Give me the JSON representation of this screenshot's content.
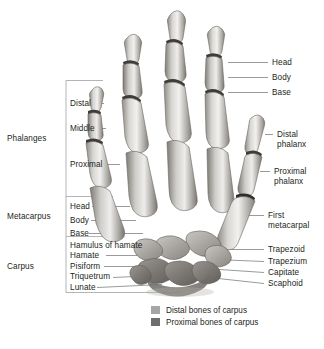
{
  "figure": {
    "title_alt": "Bones of the hand - anterior view",
    "colors": {
      "text": "#231f20",
      "leader_line": "#6d6e71",
      "bracket_line": "#939598",
      "bone_light": "#e8e6e3",
      "bone_mid": "#b9b6b2",
      "bone_dark": "#8a8782",
      "bone_outline": "#6a6763",
      "joint_dark": "#3a3a3a",
      "distal_carpus_swatch": "#a6a6a6",
      "proximal_carpus_swatch": "#6e6e6e",
      "background": "#ffffff"
    }
  },
  "groups": [
    {
      "id": "phalanges",
      "label": "Phalanges"
    },
    {
      "id": "metacarpus",
      "label": "Metacarpus"
    },
    {
      "id": "carpus",
      "label": "Carpus"
    }
  ],
  "left_labels": [
    {
      "id": "distal",
      "label": "Distal"
    },
    {
      "id": "middle",
      "label": "Middle"
    },
    {
      "id": "proximal",
      "label": "Proximal"
    },
    {
      "id": "head",
      "label": "Head"
    },
    {
      "id": "body",
      "label": "Body"
    },
    {
      "id": "base",
      "label": "Base"
    },
    {
      "id": "hamulus-of-hamate",
      "label": "Hamulus of hamate"
    },
    {
      "id": "hamate",
      "label": "Hamate"
    },
    {
      "id": "pisiform",
      "label": "Pisiform"
    },
    {
      "id": "triquetrum",
      "label": "Triquetrum"
    },
    {
      "id": "lunate",
      "label": "Lunate"
    }
  ],
  "right_labels": [
    {
      "id": "head",
      "label": "Head"
    },
    {
      "id": "body",
      "label": "Body"
    },
    {
      "id": "base",
      "label": "Base"
    },
    {
      "id": "distal-phalanx",
      "label": "Distal\nphalanx"
    },
    {
      "id": "proximal-phalanx",
      "label": "Proximal\nphalanx"
    },
    {
      "id": "first-metacarpal",
      "label": "First\nmetacarpal"
    },
    {
      "id": "trapezoid",
      "label": "Trapezoid"
    },
    {
      "id": "trapezium",
      "label": "Trapezium"
    },
    {
      "id": "capitate",
      "label": "Capitate"
    },
    {
      "id": "scaphoid",
      "label": "Scaphoid"
    }
  ],
  "legend": [
    {
      "id": "distal-bones-of-carpus",
      "label": "Distal bones of carpus",
      "color": "#a6a6a6"
    },
    {
      "id": "proximal-bones-of-carpus",
      "label": "Proximal bones of carpus",
      "color": "#6e6e6e"
    }
  ],
  "footnote": {
    "text": ""
  }
}
